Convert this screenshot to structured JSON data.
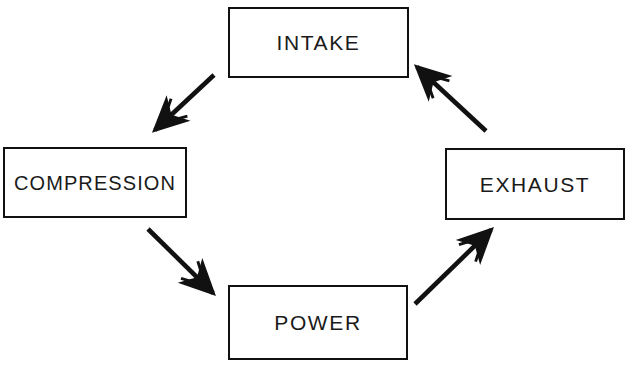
{
  "diagram": {
    "type": "cycle-flow-diagram",
    "background_color": "#ffffff",
    "stroke_color": "#111111",
    "text_color": "#1a1a1a",
    "width": 631,
    "height": 367,
    "nodes": [
      {
        "id": "intake",
        "label": "INTAKE",
        "position": "top",
        "x": 228,
        "y": 7,
        "width": 181,
        "height": 71
      },
      {
        "id": "compression",
        "label": "COMPRESSION",
        "position": "left",
        "x": 3,
        "y": 147,
        "width": 184,
        "height": 71
      },
      {
        "id": "exhaust",
        "label": "EXHAUST",
        "position": "right",
        "x": 445,
        "y": 148,
        "width": 180,
        "height": 72
      },
      {
        "id": "power",
        "label": "POWER",
        "position": "bottom",
        "x": 228,
        "y": 285,
        "width": 180,
        "height": 75
      }
    ],
    "arrows": [
      {
        "id": "intake-to-compression",
        "from": "intake",
        "to": "compression",
        "direction": "down-left",
        "x1": 214,
        "y1": 75,
        "x2": 152,
        "y2": 133
      },
      {
        "id": "compression-to-power",
        "from": "compression",
        "to": "power",
        "direction": "down-right",
        "x1": 148,
        "y1": 229,
        "x2": 216,
        "y2": 296
      },
      {
        "id": "power-to-exhaust",
        "from": "power",
        "to": "exhaust",
        "direction": "up-right",
        "x1": 415,
        "y1": 304,
        "x2": 494,
        "y2": 227
      },
      {
        "id": "exhaust-to-intake",
        "from": "exhaust",
        "to": "intake",
        "direction": "up-left",
        "x1": 486,
        "y1": 131,
        "x2": 414,
        "y2": 64
      }
    ]
  }
}
